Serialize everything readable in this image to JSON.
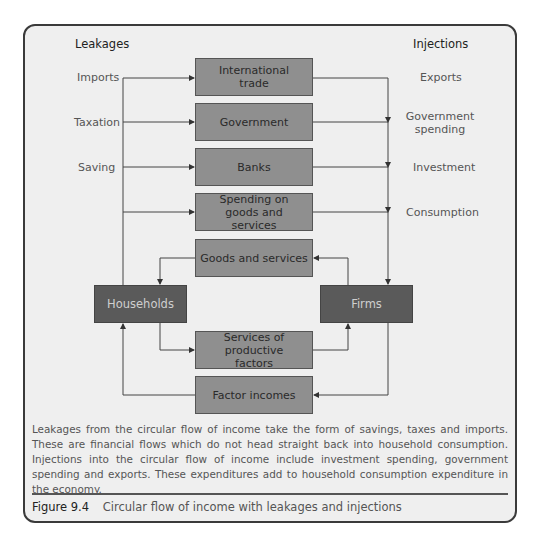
{
  "figure": {
    "headers": {
      "left": "Leakages",
      "right": "Injections"
    },
    "leakages": [
      "Imports",
      "Taxation",
      "Saving"
    ],
    "injections": [
      "Exports",
      "Government spending",
      "Investment",
      "Consumption"
    ],
    "boxes": {
      "international_trade": "International trade",
      "government": "Government",
      "banks": "Banks",
      "spending": "Spending on goods and services",
      "goods": "Goods and services",
      "services_factors": "Services of productive factors",
      "factor_incomes": "Factor incomes",
      "households": "Households",
      "firms": "Firms"
    },
    "description": "Leakages from the circular flow of income take the form of savings, taxes and imports. These are financial flows which do not head straight back into household consumption. Injections into the circular flow of income include investment spending, government spending and exports. These expenditures add to household consumption expenditure in the economy.",
    "caption_number": "Figure 9.4",
    "caption_text": "Circular flow of income with leakages and injections"
  }
}
